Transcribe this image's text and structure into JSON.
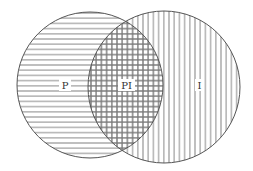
{
  "diagram": {
    "type": "venn",
    "sets": [
      {
        "id": "P",
        "label": "P",
        "hatch": "horizontal",
        "cx": 90,
        "cy": 85,
        "r": 73
      },
      {
        "id": "I",
        "label": "I",
        "hatch": "vertical",
        "cx": 164,
        "cy": 87,
        "r": 76
      }
    ],
    "intersection": {
      "label": "PI",
      "hatch": "crosshatch"
    },
    "labels": {
      "p": "P",
      "pi": "PI",
      "i": "I"
    },
    "colors": {
      "stroke": "#555555",
      "hatch": "#7a7a7a",
      "background": "#ffffff",
      "text": "#333333"
    }
  }
}
